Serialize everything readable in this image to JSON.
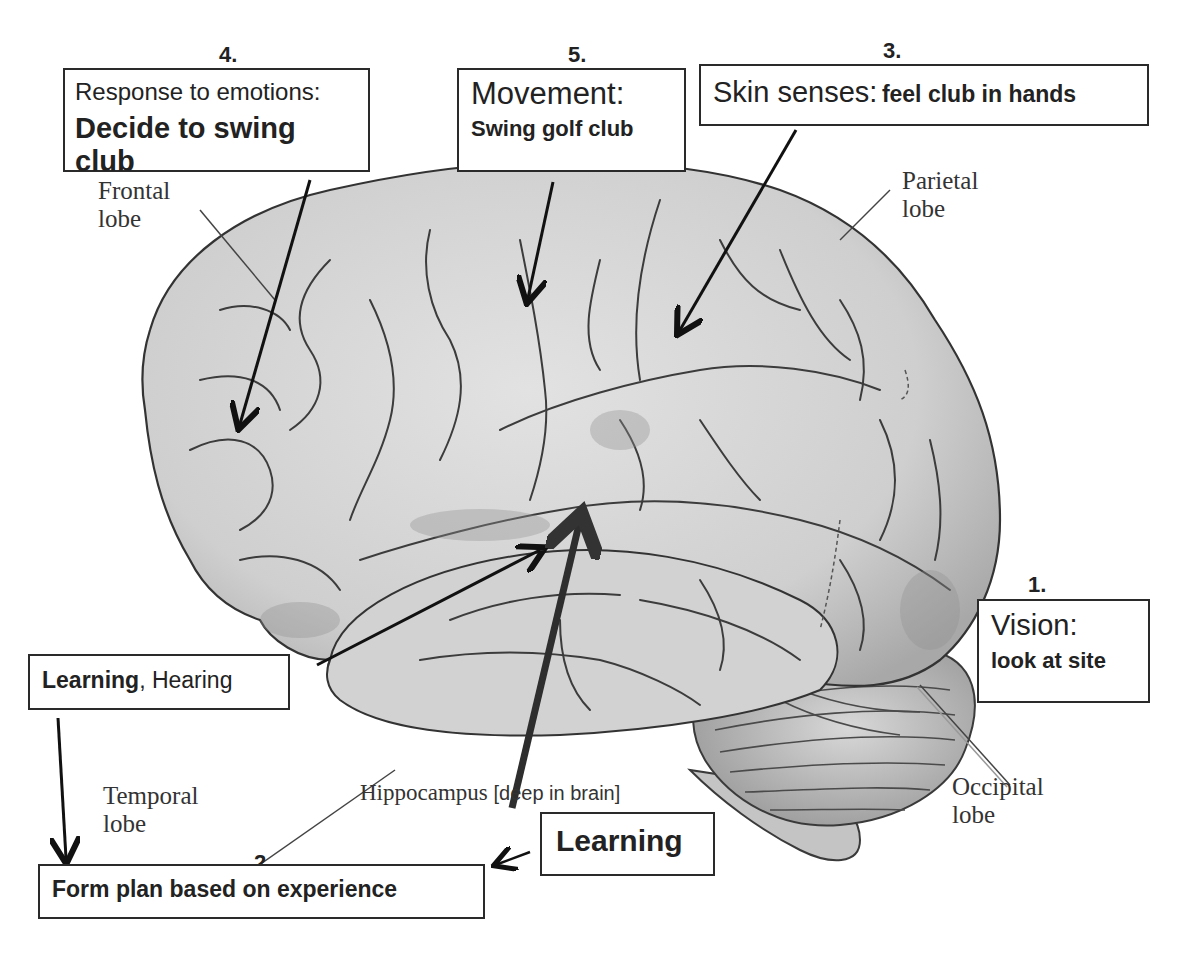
{
  "diagram": {
    "boxes": {
      "step4": {
        "number": "4.",
        "line1": "Response to emotions:",
        "line2": "Decide to swing club"
      },
      "step5": {
        "number": "5.",
        "line1": "Movement:",
        "line2": "Swing golf club"
      },
      "step3": {
        "number": "3.",
        "label": "Skin senses:",
        "detail": "feel club in hands"
      },
      "step1": {
        "number": "1.",
        "line1": "Vision:",
        "line2": "look at site"
      },
      "learning_hearing": {
        "bold": "Learning",
        "rest": ", Hearing"
      },
      "step2": {
        "number": "2.",
        "label": "Form plan based on experience"
      },
      "learning": {
        "label": "Learning"
      }
    },
    "anatomy_labels": {
      "frontal": {
        "line1": "Frontal",
        "line2": "lobe"
      },
      "parietal": {
        "line1": "Parietal",
        "line2": "lobe"
      },
      "temporal": {
        "line1": "Temporal",
        "line2": "lobe"
      },
      "occipital": {
        "line1": "Occipital",
        "line2": "lobe"
      },
      "hippocampus": {
        "name": "Hippocampus",
        "note": "[deep in brain]"
      }
    },
    "colors": {
      "brain_fill": "#d4d4d4",
      "brain_shadow": "#a9a9a9",
      "outline": "#3a3a3a",
      "box_border": "#2a2a2a",
      "text": "#222222"
    }
  }
}
